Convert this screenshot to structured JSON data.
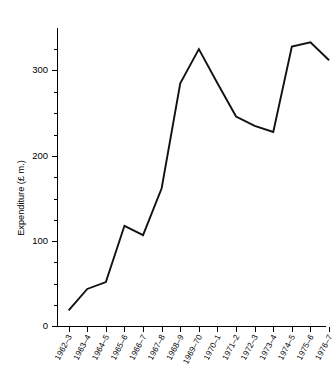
{
  "chart_data": {
    "type": "line",
    "title": "",
    "subtitle": "",
    "xlabel": "",
    "ylabel": "Expenditure (£ m.)",
    "categories": [
      "1962–3",
      "1963–4",
      "1964–5",
      "1965–6",
      "1966–7",
      "1967–8",
      "1968–9",
      "1969–70",
      "1970–1",
      "1971–2",
      "1972–3",
      "1973–4",
      "1974–5",
      "1975–6",
      "1976–7"
    ],
    "values": [
      19,
      44,
      52,
      118,
      107,
      162,
      285,
      325,
      285,
      246,
      235,
      228,
      328,
      333,
      312
    ],
    "series": [
      {
        "name": "Expenditure",
        "values": [
          19,
          44,
          52,
          118,
          107,
          162,
          285,
          325,
          285,
          246,
          235,
          228,
          328,
          333,
          312
        ]
      }
    ],
    "ylim": [
      0,
      360
    ],
    "xlim": [
      0,
      14
    ],
    "y_major_ticks": [
      0,
      100,
      200,
      300
    ],
    "y_major_tick_labels": [
      "0",
      "100",
      "200",
      "300"
    ],
    "y_minor_tick_interval": 25,
    "grid": false,
    "legend": null,
    "legend_position": "none",
    "line_color": "#111111",
    "axis_color": "#000000",
    "background_color": "#ffffff",
    "markers": false,
    "annotations": []
  }
}
